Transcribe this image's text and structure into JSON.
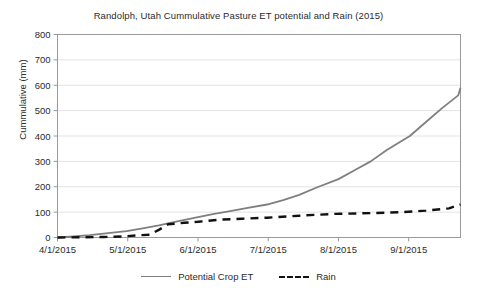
{
  "chart_data": {
    "type": "line",
    "title": "Randolph, Utah Cummulative Pasture ET potential and Rain (2015)",
    "xlabel": "",
    "ylabel": "Cummulative (mm)",
    "ylim": [
      0,
      800
    ],
    "yticks": [
      0,
      100,
      200,
      300,
      400,
      500,
      600,
      700,
      800
    ],
    "xtick_labels": [
      "4/1/2015",
      "5/1/2015",
      "6/1/2015",
      "7/1/2015",
      "8/1/2015",
      "9/1/2015"
    ],
    "xlim_labels": [
      "4/1/2015",
      "9/23/2015"
    ],
    "grid": "horizontal",
    "legend_position": "bottom",
    "series": [
      {
        "name": "Potential Crop ET",
        "style": "solid",
        "color": "#7f7f7f",
        "x_days": [
          0,
          7,
          14,
          21,
          30,
          37,
          44,
          51,
          61,
          68,
          75,
          82,
          91,
          98,
          105,
          112,
          122,
          129,
          136,
          143,
          153,
          160,
          167,
          174,
          175
        ],
        "values": [
          0,
          4,
          9,
          16,
          25,
          36,
          48,
          62,
          80,
          93,
          104,
          116,
          130,
          147,
          168,
          195,
          230,
          265,
          300,
          345,
          400,
          455,
          510,
          560,
          590
        ]
      },
      {
        "name": "Rain",
        "style": "dashed",
        "color": "#111111",
        "x_days": [
          0,
          10,
          20,
          28,
          34,
          40,
          44,
          48,
          55,
          61,
          70,
          80,
          91,
          105,
          120,
          136,
          150,
          160,
          170,
          175
        ],
        "values": [
          0,
          1,
          2,
          4,
          8,
          11,
          30,
          52,
          58,
          62,
          70,
          74,
          78,
          86,
          93,
          96,
          100,
          106,
          115,
          130
        ]
      }
    ],
    "series_endpoints": [
      {
        "name": "Potential Crop ET",
        "final_value": 655
      },
      {
        "name": "Rain",
        "final_value": 138
      }
    ]
  },
  "legend": {
    "entries": [
      {
        "label": "Potential Crop ET",
        "style": "solid"
      },
      {
        "label": "Rain",
        "style": "dashed"
      }
    ]
  }
}
